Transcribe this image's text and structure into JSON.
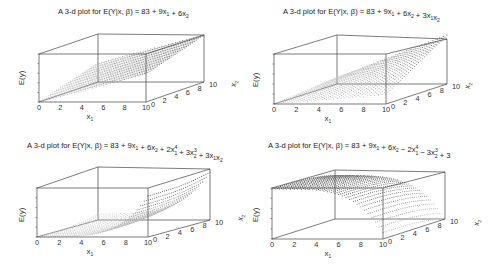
{
  "chart_data": [
    {
      "type": "scatter3d",
      "title": "A 3-d plot for E(Y|x, β) = 83 + 9x₁ + 6x₂",
      "title_parts": [
        [
          "A 3-d plot for E(Y|x, β) = 83 + 9x",
          ""
        ],
        [
          "1",
          ""
        ],
        [
          " + 6x",
          ""
        ],
        [
          "2",
          ""
        ]
      ],
      "formula": {
        "b0": 83,
        "b1": 9,
        "b2": 6,
        "b11": 0,
        "b22": 0,
        "b12": 0,
        "p1": 1,
        "p2": 1
      },
      "xlabel": "x1",
      "ylabel": "x2",
      "zlabel": "E(y)",
      "x_ticks": [
        0,
        2,
        4,
        6,
        8,
        10
      ],
      "y_ticks": [
        0,
        2,
        4,
        6,
        8,
        10
      ],
      "xlim": [
        0,
        10
      ],
      "ylim": [
        0,
        10
      ],
      "surface_desc": "plane rising linearly in x1 and x2"
    },
    {
      "type": "scatter3d",
      "title": "A 3-d plot for E(Y|x, β) = 83 + 9x₁ + 6x₂ + 3x₁x₂",
      "formula": {
        "b0": 83,
        "b1": 9,
        "b2": 6,
        "b11": 0,
        "b22": 0,
        "b12": 3,
        "p1": 1,
        "p2": 1
      },
      "xlabel": "x1",
      "ylabel": "x2",
      "zlabel": "E(y)",
      "x_ticks": [
        0,
        2,
        4,
        6,
        8,
        10
      ],
      "y_ticks": [
        0,
        2,
        4,
        6,
        8,
        10
      ],
      "xlim": [
        0,
        10
      ],
      "ylim": [
        0,
        10
      ],
      "surface_desc": "twisted plane with interaction term"
    },
    {
      "type": "scatter3d",
      "title": "A 3-d plot for E(Y|x, β) = 83 + 9x₁ + 6x₂ + 2x₁⁴ + 3x₂³ + 3x₁x₂",
      "formula": {
        "b0": 83,
        "b1": 9,
        "b2": 6,
        "b11": 2,
        "b22": 3,
        "b12": 3,
        "p1": 4,
        "p2": 3
      },
      "xlabel": "x1",
      "ylabel": "x2",
      "zlabel": "E(y)",
      "x_ticks": [
        0,
        2,
        4,
        6,
        8,
        10
      ],
      "y_ticks": [
        0,
        2,
        4,
        6,
        8,
        10
      ],
      "xlim": [
        0,
        10
      ],
      "ylim": [
        0,
        10
      ],
      "surface_desc": "convex surface curving upward steeply in x1"
    },
    {
      "type": "scatter3d",
      "title": "A 3-d plot for E(Y|x, β) = 83 + 9x₁ + 6x₂ − 2x₁⁴ − 3x₂³ + 3",
      "formula": {
        "b0": 86,
        "b1": 9,
        "b2": 6,
        "b11": -2,
        "b22": -3,
        "b12": 0,
        "p1": 4,
        "p2": 3
      },
      "xlabel": "x1",
      "ylabel": "x2",
      "zlabel": "E(y)",
      "x_ticks": [
        0,
        2,
        4,
        6,
        8,
        10
      ],
      "y_ticks": [
        0,
        2,
        4,
        6,
        8,
        10
      ],
      "xlim": [
        0,
        10
      ],
      "ylim": [
        0,
        10
      ],
      "surface_desc": "concave surface curving downward"
    }
  ],
  "panels": [
    {
      "title_html": [
        "A 3-d plot for E(Y|x, β) = 83 + 9x",
        "1",
        " + 6x",
        "2"
      ],
      "title_pos": [
        58,
        14
      ],
      "box": {
        "fl": [
          39,
          54
        ],
        "fr": [
          146,
          54
        ],
        "bl": [
          98,
          34
        ],
        "br": [
          204,
          35
        ],
        "flb": [
          39,
          102
        ],
        "frb": [
          146,
          102
        ],
        "blb": [
          98,
          82
        ],
        "brb": [
          204,
          82
        ]
      },
      "z_range": "auto",
      "zlabel_pos": [
        24,
        78
      ],
      "xlabel_pos": [
        90,
        119
      ],
      "ylabel_pos": [
        236,
        84
      ]
    },
    {
      "title_html": [
        "A 3-d plot for E(Y|x, β) = 83 + 9x",
        "1",
        " + 6x",
        "2",
        " + 3x",
        "1",
        "x",
        "2"
      ],
      "title_pos": [
        283,
        14
      ],
      "box": {
        "fl": [
          274,
          54
        ],
        "fr": [
          386,
          54
        ],
        "bl": [
          337,
          35
        ],
        "br": [
          447,
          39
        ],
        "flb": [
          274,
          104
        ],
        "frb": [
          386,
          104
        ],
        "blb": [
          337,
          84
        ],
        "brb": [
          447,
          84
        ]
      },
      "z_range": "auto",
      "zlabel_pos": [
        258,
        80
      ],
      "xlabel_pos": [
        328,
        121
      ],
      "ylabel_pos": [
        470,
        86
      ]
    },
    {
      "title_html": [
        "A 3-d plot for E(Y|x, β) = 83 + 9x",
        "1",
        " + 6x",
        "2",
        " + 2x",
        "1:4",
        " + 3x",
        "2:3",
        " + 3x",
        "1",
        "x",
        "2"
      ],
      "title_pos": [
        27,
        148
      ],
      "box": {
        "fl": [
          37,
          188
        ],
        "fr": [
          148,
          188
        ],
        "bl": [
          98,
          167
        ],
        "br": [
          210,
          169
        ],
        "flb": [
          37,
          237
        ],
        "frb": [
          148,
          237
        ],
        "blb": [
          98,
          220
        ],
        "brb": [
          210,
          220
        ]
      },
      "z_range": "auto",
      "zlabel_pos": [
        24,
        215
      ],
      "xlabel_pos": [
        90,
        254
      ],
      "ylabel_pos": [
        243,
        218
      ]
    },
    {
      "title_html": [
        "A 3-d plot for E(Y|x, β) = 83 + 9x",
        "1",
        " + 6x",
        "2",
        " − 2x",
        "1:4",
        " − 3x",
        "2:3",
        " + 3"
      ],
      "title_pos": [
        268,
        148
      ],
      "box": {
        "fl": [
          272,
          188
        ],
        "fr": [
          383,
          188
        ],
        "bl": [
          335,
          170
        ],
        "br": [
          445,
          172
        ],
        "flb": [
          272,
          239
        ],
        "frb": [
          383,
          239
        ],
        "blb": [
          335,
          219
        ],
        "brb": [
          445,
          219
        ]
      },
      "z_range": "auto",
      "zlabel_pos": [
        258,
        215
      ],
      "xlabel_pos": [
        328,
        256
      ],
      "ylabel_pos": [
        479,
        223
      ]
    }
  ],
  "labels": {
    "zlabel": "E(y)",
    "xlabel_main": "x",
    "xlabel_sub": "1",
    "ylabel_main": "x",
    "ylabel_sub": "2"
  },
  "style": {
    "line_color": "#444444",
    "dot_dark": "#3a3a3a",
    "dot_light": "#c8c8c8",
    "background": "#ffffff"
  }
}
